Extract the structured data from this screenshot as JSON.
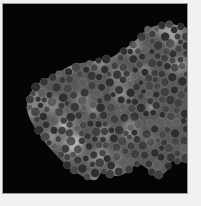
{
  "page": {
    "background": "#f1f1ef",
    "frame_line_color": "#9a9a9a"
  },
  "image": {
    "subject": "irregular cluster of densely packed gray particles with bright glow patches on black",
    "background": "#050505",
    "offset": {
      "x": 3,
      "y": 4
    },
    "size": {
      "width": 184,
      "height": 189
    },
    "cluster": {
      "outline": [
        [
          24,
          99
        ],
        [
          28,
          88
        ],
        [
          37,
          78
        ],
        [
          49,
          72
        ],
        [
          59,
          66
        ],
        [
          72,
          60
        ],
        [
          85,
          58
        ],
        [
          97,
          56
        ],
        [
          109,
          53
        ],
        [
          119,
          46
        ],
        [
          127,
          41
        ],
        [
          135,
          34
        ],
        [
          143,
          26
        ],
        [
          152,
          22
        ],
        [
          165,
          20
        ],
        [
          177,
          22
        ],
        [
          186,
          28
        ],
        [
          188,
          60
        ],
        [
          188,
          100
        ],
        [
          188,
          130
        ],
        [
          186,
          152
        ],
        [
          177,
          158
        ],
        [
          170,
          155
        ],
        [
          163,
          168
        ],
        [
          152,
          172
        ],
        [
          143,
          164
        ],
        [
          134,
          160
        ],
        [
          125,
          168
        ],
        [
          113,
          172
        ],
        [
          100,
          168
        ],
        [
          93,
          176
        ],
        [
          83,
          174
        ],
        [
          72,
          168
        ],
        [
          62,
          160
        ],
        [
          52,
          150
        ],
        [
          44,
          141
        ],
        [
          37,
          131
        ],
        [
          30,
          121
        ],
        [
          25,
          110
        ]
      ],
      "base_color": "#585858",
      "glow": {
        "color_rgb": [
          200,
          200,
          200
        ],
        "spot_count": 28,
        "radius_min": 7,
        "radius_max": 16,
        "core_alpha": 0.5,
        "bloom_count": 10,
        "bloom_alpha": 0.13
      },
      "particles": {
        "seed": 42,
        "target_count": 500,
        "max_attempts": 9000,
        "radius_min": 1.8,
        "radius_max": 4.6,
        "gap_factor": 0.92,
        "dark_shades": [
          "#2e2e2e",
          "#373737",
          "#3f3f3f",
          "#474747"
        ],
        "light_shade": "#5d5d5d",
        "light_fraction": 0.15,
        "rim_color": "rgba(190,190,190,0.28)",
        "rim_width": 0.6
      }
    }
  }
}
